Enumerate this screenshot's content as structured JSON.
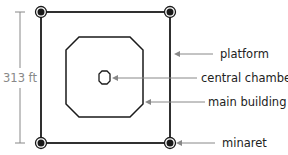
{
  "diagram": {
    "dimension": {
      "label": "313 ft"
    },
    "labels": {
      "platform": "platform",
      "central_chamber": "central chamber",
      "main_building": "main building",
      "minaret": "minaret"
    },
    "colors": {
      "line": "#1a1a1a",
      "arrow": "#888888",
      "dimension": "#888888",
      "text": "#222222"
    },
    "minarets": [
      {
        "name": "top-left",
        "cx": 41,
        "cy": 12
      },
      {
        "name": "top-right",
        "cx": 170,
        "cy": 12
      },
      {
        "name": "bottom-left",
        "cx": 41,
        "cy": 143
      },
      {
        "name": "bottom-right",
        "cx": 170,
        "cy": 143
      }
    ]
  }
}
